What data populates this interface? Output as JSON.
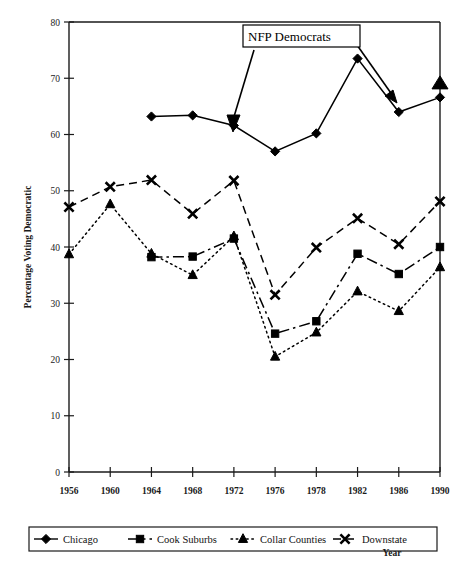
{
  "chart_data": {
    "type": "line",
    "title": "",
    "xlabel": "Year",
    "ylabel": "Percentage Voting Democratic",
    "categories": [
      "1956",
      "1960",
      "1964",
      "1968",
      "1972",
      "1976",
      "1978",
      "1982",
      "1986",
      "1990"
    ],
    "ylim": [
      0,
      80
    ],
    "yticks": [
      0,
      10,
      20,
      30,
      40,
      50,
      60,
      70,
      80
    ],
    "grid": false,
    "legend_position": "bottom",
    "series": [
      {
        "name": "Chicago",
        "marker": "diamond",
        "linestyle": "solid",
        "values": [
          null,
          null,
          63.2,
          63.4,
          61.6,
          57.0,
          60.2,
          73.5,
          64.0,
          66.6
        ]
      },
      {
        "name": "Cook Suburbs",
        "marker": "square",
        "linestyle": "dashdot",
        "values": [
          null,
          null,
          38.2,
          38.3,
          41.5,
          24.6,
          26.8,
          38.8,
          35.2,
          40.0
        ]
      },
      {
        "name": "Collar Counties",
        "marker": "triangle",
        "linestyle": "dotted",
        "values": [
          38.7,
          47.6,
          38.8,
          35.0,
          41.9,
          20.5,
          24.8,
          32.1,
          28.6,
          36.4
        ]
      },
      {
        "name": "Downstate",
        "marker": "cross",
        "linestyle": "dashed",
        "values": [
          47.1,
          50.7,
          51.9,
          45.9,
          51.8,
          31.5,
          39.9,
          45.1,
          40.5,
          48.1
        ]
      }
    ],
    "annotations": [
      {
        "text": "NFP Democrats",
        "points_to": [
          "Chicago 1972",
          "Collar Counties 1990"
        ],
        "extra_point": {
          "series": "Collar Counties",
          "category": "1990",
          "value": 69.0
        }
      }
    ]
  },
  "legend": {
    "entries": [
      {
        "label": "Chicago",
        "marker": "diamond",
        "linestyle": "solid"
      },
      {
        "label": "Cook Suburbs",
        "marker": "square",
        "linestyle": "dashdot"
      },
      {
        "label": "Collar Counties",
        "marker": "triangle",
        "linestyle": "dotted"
      },
      {
        "label": "Downstate",
        "marker": "cross",
        "linestyle": "dashed"
      }
    ]
  },
  "colors": {
    "ink": "#000000",
    "axis": "#1a1a1a",
    "background": "#ffffff"
  }
}
